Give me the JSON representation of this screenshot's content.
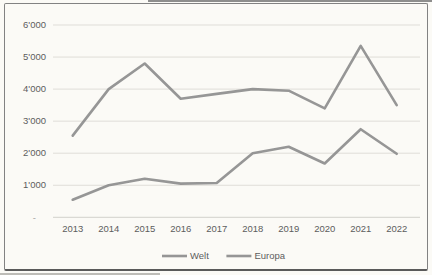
{
  "figure": {
    "kind": "scanned-line-chart",
    "background_color": "#fbfaf6",
    "border_color": "#828282"
  },
  "chart_data": {
    "type": "line",
    "title": "",
    "xlabel": "",
    "ylabel": "",
    "categories": [
      "2013",
      "2014",
      "2015",
      "2016",
      "2017",
      "2018",
      "2019",
      "2020",
      "2021",
      "2022"
    ],
    "series": [
      {
        "name": "Welt",
        "color": "#8d8d8d",
        "values": [
          2550,
          4000,
          4800,
          3700,
          3850,
          4000,
          3950,
          3400,
          5350,
          3500
        ]
      },
      {
        "name": "Europa",
        "color": "#8d8d8d",
        "values": [
          550,
          1000,
          1200,
          1050,
          1070,
          2000,
          2200,
          1680,
          2750,
          1980
        ]
      }
    ],
    "ylim": [
      0,
      6000
    ],
    "ytick_step": 1000,
    "ytick_labels": [
      "-",
      "1'000",
      "2'000",
      "3'000",
      "4'000",
      "5'000",
      "6'000"
    ],
    "grid": true,
    "legend_position": "bottom",
    "colors": {
      "line_gray": "#8d8d8d",
      "gridline": "#dfddd8",
      "label_text": "#5d5d5d"
    }
  }
}
